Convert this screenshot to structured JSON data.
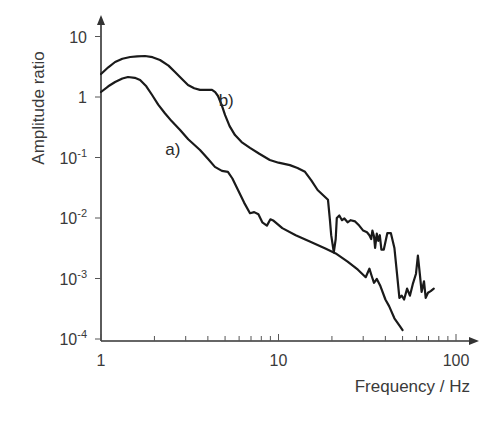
{
  "chart_data": {
    "type": "line",
    "title": "",
    "xlabel": "Frequency / Hz",
    "ylabel": "Amplitude ratio",
    "xscale": "log",
    "yscale": "log",
    "xlim": [
      1,
      100
    ],
    "ylim": [
      0.0001,
      10
    ],
    "grid": false,
    "x_ticks": [
      {
        "value": 1,
        "label": "1"
      },
      {
        "value": 10,
        "label": "10"
      },
      {
        "value": 100,
        "label": "100"
      }
    ],
    "y_ticks": [
      {
        "value": 10,
        "base": "10",
        "exp": ""
      },
      {
        "value": 1,
        "base": "1",
        "exp": ""
      },
      {
        "value": 0.1,
        "base": "10",
        "exp": "-1"
      },
      {
        "value": 0.01,
        "base": "10",
        "exp": "-2"
      },
      {
        "value": 0.001,
        "base": "10",
        "exp": "-3"
      },
      {
        "value": 0.0001,
        "base": "10",
        "exp": "-4"
      }
    ],
    "series": [
      {
        "name": "a)",
        "label_at": {
          "x": 2.3,
          "y": 0.11
        },
        "points": [
          [
            1.0,
            1.21
          ],
          [
            1.1,
            1.5
          ],
          [
            1.2,
            1.77
          ],
          [
            1.32,
            2.02
          ],
          [
            1.42,
            2.14
          ],
          [
            1.55,
            2.08
          ],
          [
            1.66,
            1.91
          ],
          [
            1.8,
            1.5
          ],
          [
            1.94,
            1.08
          ],
          [
            2.1,
            0.75
          ],
          [
            2.29,
            0.54
          ],
          [
            2.5,
            0.4
          ],
          [
            2.79,
            0.285
          ],
          [
            3.1,
            0.2
          ],
          [
            3.61,
            0.133
          ],
          [
            4.0,
            0.095
          ],
          [
            4.38,
            0.07
          ],
          [
            4.8,
            0.06
          ],
          [
            5.19,
            0.058
          ],
          [
            5.5,
            0.045
          ],
          [
            5.91,
            0.029
          ],
          [
            6.4,
            0.018
          ],
          [
            6.91,
            0.012
          ],
          [
            7.3,
            0.0125
          ],
          [
            7.7,
            0.0115
          ],
          [
            8.1,
            0.0085
          ],
          [
            8.6,
            0.0075
          ],
          [
            9.0,
            0.0095
          ],
          [
            9.4,
            0.009
          ],
          [
            10.5,
            0.0068
          ],
          [
            12.5,
            0.0052
          ],
          [
            15.0,
            0.0041
          ],
          [
            18.5,
            0.0031
          ],
          [
            21.0,
            0.0026
          ],
          [
            24.5,
            0.0019
          ],
          [
            28.0,
            0.0014
          ],
          [
            31.0,
            0.00105
          ],
          [
            32.5,
            0.00145
          ],
          [
            33.5,
            0.0011
          ],
          [
            34.5,
            0.00085
          ],
          [
            35.8,
            0.00098
          ],
          [
            37.5,
            0.00075
          ],
          [
            40.0,
            0.00045
          ],
          [
            42.0,
            0.00035
          ],
          [
            45.0,
            0.00022
          ],
          [
            48.5,
            0.00016
          ],
          [
            50.0,
            0.00014
          ]
        ]
      },
      {
        "name": "b)",
        "label_at": {
          "x": 4.6,
          "y": 0.72
        },
        "points": [
          [
            1.0,
            2.4
          ],
          [
            1.1,
            3.1
          ],
          [
            1.2,
            3.79
          ],
          [
            1.32,
            4.3
          ],
          [
            1.46,
            4.58
          ],
          [
            1.6,
            4.7
          ],
          [
            1.77,
            4.76
          ],
          [
            1.95,
            4.55
          ],
          [
            2.15,
            4.09
          ],
          [
            2.4,
            3.3
          ],
          [
            2.61,
            2.59
          ],
          [
            2.85,
            2.0
          ],
          [
            3.09,
            1.58
          ],
          [
            3.35,
            1.4
          ],
          [
            3.61,
            1.31
          ],
          [
            3.9,
            1.31
          ],
          [
            4.22,
            1.31
          ],
          [
            4.4,
            1.2
          ],
          [
            4.56,
            1.04
          ],
          [
            4.8,
            0.72
          ],
          [
            5.0,
            0.5
          ],
          [
            5.3,
            0.33
          ],
          [
            5.69,
            0.235
          ],
          [
            6.2,
            0.18
          ],
          [
            6.91,
            0.144
          ],
          [
            7.8,
            0.115
          ],
          [
            8.93,
            0.091
          ],
          [
            10.0,
            0.082
          ],
          [
            11.6,
            0.075
          ],
          [
            12.8,
            0.067
          ],
          [
            14.1,
            0.058
          ],
          [
            15.3,
            0.042
          ],
          [
            16.6,
            0.029
          ],
          [
            17.8,
            0.024
          ],
          [
            19.0,
            0.02
          ],
          [
            19.5,
            0.009
          ],
          [
            19.8,
            0.0052
          ],
          [
            20.5,
            0.0027
          ],
          [
            21.0,
            0.0045
          ],
          [
            21.3,
            0.01
          ],
          [
            22.0,
            0.011
          ],
          [
            22.8,
            0.0092
          ],
          [
            23.5,
            0.0098
          ],
          [
            24.5,
            0.0085
          ],
          [
            25.5,
            0.0092
          ],
          [
            27.0,
            0.0088
          ],
          [
            28.5,
            0.0075
          ],
          [
            30.0,
            0.0062
          ],
          [
            31.5,
            0.0058
          ],
          [
            32.5,
            0.0052
          ],
          [
            33.3,
            0.0045
          ],
          [
            33.8,
            0.0062
          ],
          [
            34.5,
            0.005
          ],
          [
            35.0,
            0.0032
          ],
          [
            35.8,
            0.0055
          ],
          [
            36.5,
            0.0042
          ],
          [
            37.2,
            0.0052
          ],
          [
            38.0,
            0.003
          ],
          [
            39.2,
            0.003
          ],
          [
            41.0,
            0.0056
          ],
          [
            43.0,
            0.0056
          ],
          [
            45.0,
            0.0032
          ],
          [
            46.5,
            0.0012
          ],
          [
            48.0,
            0.00048
          ],
          [
            49.5,
            0.00052
          ],
          [
            51.0,
            0.00045
          ],
          [
            53.0,
            0.00068
          ],
          [
            55.0,
            0.00052
          ],
          [
            57.0,
            0.0008
          ],
          [
            59.5,
            0.0012
          ],
          [
            61.0,
            0.0024
          ],
          [
            62.5,
            0.0012
          ],
          [
            64.0,
            0.0006
          ],
          [
            66.0,
            0.0009
          ],
          [
            67.5,
            0.00048
          ],
          [
            69.5,
            0.00058
          ],
          [
            72.0,
            0.00062
          ],
          [
            75.0,
            0.00068
          ]
        ]
      }
    ]
  }
}
